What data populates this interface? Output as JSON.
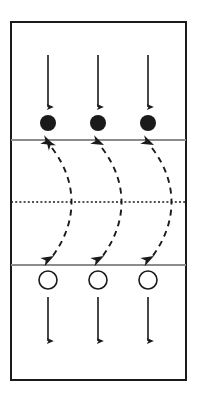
{
  "diagram": {
    "type": "sports-court-drill",
    "canvas": {
      "width": 197,
      "height": 401
    },
    "colors": {
      "background": "#ffffff",
      "border": "#1a1a1a",
      "zone_line": "#8c8c8c",
      "center_line": "#1a1a1a",
      "filled_player": "#1a1a1a",
      "open_player_stroke": "#1a1a1a",
      "open_player_fill": "#ffffff",
      "solid_arrow": "#1a1a1a",
      "dashed_arrow": "#1a1a1a"
    },
    "court": {
      "label": "court-boundary",
      "x": 11,
      "y": 22,
      "width": 175,
      "height": 358,
      "stroke_width": 2
    },
    "zone_lines": [
      {
        "name": "upper-attack-line",
        "y": 140,
        "x_start": 11,
        "x_end": 186
      },
      {
        "name": "lower-attack-line",
        "y": 265,
        "x_start": 11,
        "x_end": 186
      }
    ],
    "center_line": {
      "name": "center-net-line",
      "y": 202,
      "x_start": 11,
      "x_end": 186,
      "style": "dotted"
    },
    "columns_x": [
      48,
      98,
      148
    ],
    "filled_players": {
      "group_label": "filled-player-row",
      "cy": 123,
      "r": 8,
      "count": 3,
      "style": "filled"
    },
    "open_players": {
      "group_label": "open-player-row",
      "cy": 280,
      "r": 9,
      "count": 3,
      "style": "open"
    },
    "up_arrows": {
      "group_label": "upward-movement-arrows",
      "count": 3,
      "tail_y": 112,
      "head_y": 55,
      "direction": "up"
    },
    "down_arrows": {
      "group_label": "downward-movement-arrows",
      "count": 3,
      "tail_y": 297,
      "head_y": 350,
      "direction": "down"
    },
    "dashed_curves": {
      "group_label": "transition-curves",
      "count": 3,
      "style": "dashed",
      "heads": "both",
      "top_y": 143,
      "bottom_y": 262,
      "bulge": 26,
      "dash_pattern": "6 5"
    },
    "legend": {
      "filled_circle": "front-row-player",
      "open_circle": "back-row-player",
      "solid_arrow": "player-movement",
      "dashed_arrow": "rotation-path"
    }
  }
}
